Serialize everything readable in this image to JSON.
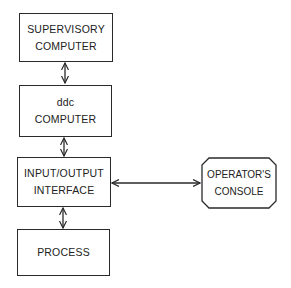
{
  "diagram": {
    "type": "block-diagram",
    "nodes": [
      {
        "id": "supervisory",
        "lines": [
          "SUPERVISORY",
          "COMPUTER"
        ]
      },
      {
        "id": "ddc",
        "lines": [
          "ddc",
          "COMPUTER"
        ]
      },
      {
        "id": "io",
        "lines": [
          "INPUT/OUTPUT",
          "INTERFACE"
        ]
      },
      {
        "id": "process",
        "lines": [
          "PROCESS"
        ]
      },
      {
        "id": "console",
        "lines": [
          "OPERATOR'S",
          "CONSOLE"
        ]
      }
    ],
    "edges": [
      {
        "from": "supervisory",
        "to": "ddc",
        "direction": "bidirectional"
      },
      {
        "from": "ddc",
        "to": "io",
        "direction": "bidirectional"
      },
      {
        "from": "io",
        "to": "process",
        "direction": "bidirectional"
      },
      {
        "from": "io",
        "to": "console",
        "direction": "bidirectional"
      }
    ],
    "colors": {
      "stroke": "#2a2a2a",
      "background": "#ffffff"
    }
  }
}
